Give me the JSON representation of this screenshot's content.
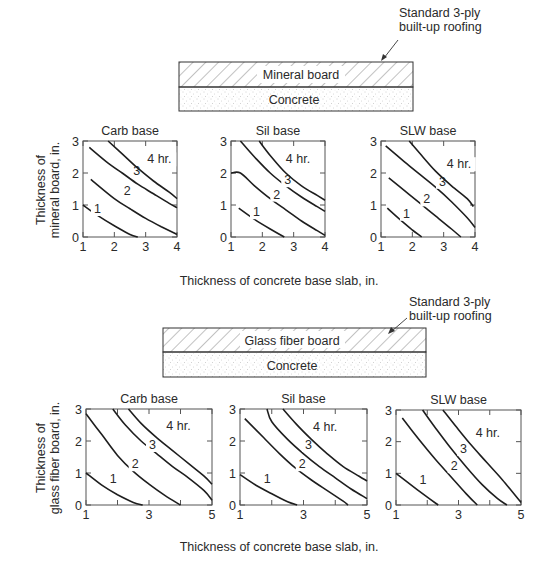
{
  "figure": {
    "section_1": {
      "assembly": {
        "roofing_note": [
          "Standard 3-ply",
          "built-up roofing"
        ],
        "board_label": "Mineral board",
        "base_label": "Concrete"
      },
      "ylabel": [
        "Thickness of",
        "mineral board, in."
      ],
      "xlabel": "Thickness of concrete base slab, in."
    },
    "section_2": {
      "assembly": {
        "roofing_note": [
          "Standard 3-ply",
          "built-up roofing"
        ],
        "board_label": "Glass fiber board",
        "base_label": "Concrete"
      },
      "ylabel": [
        "Thickness of",
        "glass fiber board, in."
      ],
      "xlabel": "Thickness of concrete base slab, in."
    }
  },
  "chart_data": [
    {
      "type": "line",
      "section": "mineral board",
      "title": "Carb base",
      "xlabel": "Thickness of concrete base slab, in.",
      "ylabel": "Thickness of mineral board, in.",
      "xlim": [
        1,
        4
      ],
      "ylim": [
        0,
        3
      ],
      "xticks": [
        1,
        2,
        3,
        4
      ],
      "yticks": [
        0,
        1,
        2,
        3
      ],
      "series": [
        {
          "name": "1",
          "label_at": [
            1.35,
            0.75
          ],
          "x": [
            1.0,
            1.5,
            2.0,
            2.5,
            2.75
          ],
          "y": [
            1.0,
            0.65,
            0.35,
            0.08,
            0.0
          ]
        },
        {
          "name": "2",
          "label_at": [
            2.3,
            1.3
          ],
          "x": [
            1.25,
            2.0,
            2.5,
            3.0,
            3.5,
            4.0
          ],
          "y": [
            1.8,
            1.2,
            0.88,
            0.58,
            0.32,
            0.08
          ]
        },
        {
          "name": "3",
          "label_at": [
            2.6,
            1.95
          ],
          "x": [
            1.2,
            1.75,
            2.25,
            2.75,
            3.25,
            3.75,
            4.0
          ],
          "y": [
            2.8,
            2.35,
            2.0,
            1.65,
            1.35,
            1.05,
            0.92
          ]
        },
        {
          "name": "4 hr.",
          "label_at": [
            3.05,
            2.3
          ],
          "x": [
            1.8,
            2.25,
            2.75,
            3.25,
            3.75,
            4.0
          ],
          "y": [
            3.0,
            2.6,
            2.15,
            1.75,
            1.4,
            1.2
          ]
        }
      ]
    },
    {
      "type": "line",
      "section": "mineral board",
      "title": "Sil base",
      "xlabel": "Thickness of concrete base slab, in.",
      "ylabel": "Thickness of mineral board, in.",
      "xlim": [
        1,
        4
      ],
      "ylim": [
        0,
        3
      ],
      "xticks": [
        1,
        2,
        3,
        4
      ],
      "yticks": [
        0,
        1,
        2,
        3
      ],
      "series": [
        {
          "name": "1",
          "label_at": [
            1.7,
            0.65
          ],
          "x": [
            1.25,
            1.75,
            2.25,
            2.7
          ],
          "y": [
            0.9,
            0.55,
            0.25,
            0.0
          ]
        },
        {
          "name": "2",
          "label_at": [
            2.35,
            1.2
          ],
          "x": [
            1.0,
            1.3,
            1.75,
            2.25,
            2.75,
            3.25,
            3.75,
            4.0
          ],
          "y": [
            2.0,
            2.0,
            1.6,
            1.2,
            0.85,
            0.5,
            0.2,
            0.05
          ]
        },
        {
          "name": "3",
          "label_at": [
            2.7,
            1.65
          ],
          "x": [
            1.3,
            1.75,
            2.25,
            2.75,
            3.25,
            3.75,
            4.0
          ],
          "y": [
            3.0,
            2.5,
            2.0,
            1.6,
            1.25,
            0.95,
            0.8
          ]
        },
        {
          "name": "4 hr.",
          "label_at": [
            2.75,
            2.3
          ],
          "x": [
            1.9,
            2.25,
            2.75,
            3.25,
            3.75,
            4.0
          ],
          "y": [
            3.0,
            2.55,
            2.0,
            1.6,
            1.3,
            1.15
          ]
        }
      ]
    },
    {
      "type": "line",
      "section": "mineral board",
      "title": "SLW base",
      "xlabel": "Thickness of concrete base slab, in.",
      "ylabel": "Thickness of mineral board, in.",
      "xlim": [
        1,
        4
      ],
      "ylim": [
        0,
        3
      ],
      "xticks": [
        1,
        2,
        3,
        4
      ],
      "yticks": [
        0,
        1,
        2,
        3
      ],
      "series": [
        {
          "name": "1",
          "label_at": [
            1.7,
            0.6
          ],
          "x": [
            1.2,
            1.6,
            2.0,
            2.3
          ],
          "y": [
            0.9,
            0.55,
            0.22,
            0.0
          ]
        },
        {
          "name": "2",
          "label_at": [
            2.35,
            1.05
          ],
          "x": [
            1.25,
            1.75,
            2.25,
            2.75,
            3.25,
            3.55
          ],
          "y": [
            1.85,
            1.45,
            1.05,
            0.65,
            0.25,
            0.0
          ]
        },
        {
          "name": "3",
          "label_at": [
            2.85,
            1.6
          ],
          "x": [
            1.15,
            1.75,
            2.25,
            2.75,
            3.25,
            3.75,
            4.0
          ],
          "y": [
            2.85,
            2.35,
            1.95,
            1.55,
            1.1,
            0.6,
            0.3
          ]
        },
        {
          "name": "4 hr.",
          "label_at": [
            3.1,
            2.15
          ],
          "x": [
            1.9,
            2.25,
            2.75,
            3.25,
            3.75,
            3.95
          ],
          "y": [
            3.0,
            2.6,
            2.05,
            1.6,
            1.2,
            0.95
          ]
        }
      ]
    },
    {
      "type": "line",
      "section": "glass fiber board",
      "title": "Carb base",
      "xlabel": "Thickness of concrete base slab, in.",
      "ylabel": "Thickness of glass fiber board, in.",
      "xlim": [
        1,
        5
      ],
      "ylim": [
        0,
        3
      ],
      "xticks": [
        1,
        2,
        3,
        4,
        5
      ],
      "xticklabels": [
        "1",
        "",
        "3",
        "",
        "5"
      ],
      "yticks": [
        0,
        1,
        2,
        3
      ],
      "series": [
        {
          "name": "1",
          "label_at": [
            1.75,
            0.7
          ],
          "x": [
            1.0,
            1.5,
            2.0,
            2.5,
            2.8
          ],
          "y": [
            1.0,
            0.62,
            0.32,
            0.08,
            0.0
          ]
        },
        {
          "name": "2",
          "label_at": [
            2.45,
            1.15
          ],
          "x": [
            1.0,
            1.5,
            2.0,
            2.5,
            3.0,
            3.5,
            4.0
          ],
          "y": [
            2.85,
            2.2,
            1.55,
            1.05,
            0.65,
            0.3,
            0.0
          ]
        },
        {
          "name": "3",
          "label_at": [
            3.0,
            1.75
          ],
          "x": [
            1.85,
            2.25,
            2.75,
            3.25,
            3.75,
            4.25,
            4.75,
            5.0
          ],
          "y": [
            3.0,
            2.5,
            2.0,
            1.6,
            1.2,
            0.85,
            0.45,
            0.15
          ]
        },
        {
          "name": "4 hr.",
          "label_at": [
            3.55,
            2.35
          ],
          "x": [
            2.35,
            2.75,
            3.25,
            3.75,
            4.25,
            4.75,
            5.0
          ],
          "y": [
            3.0,
            2.55,
            2.1,
            1.7,
            1.3,
            0.9,
            0.65
          ]
        }
      ]
    },
    {
      "type": "line",
      "section": "glass fiber board",
      "title": "Sil base",
      "xlabel": "Thickness of concrete base slab, in.",
      "ylabel": "Thickness of glass fiber board, in.",
      "xlim": [
        1,
        5
      ],
      "ylim": [
        0,
        3
      ],
      "xticks": [
        1,
        2,
        3,
        4,
        5
      ],
      "xticklabels": [
        "1",
        "",
        "3",
        "",
        "5"
      ],
      "yticks": [
        0,
        1,
        2,
        3
      ],
      "series": [
        {
          "name": "1",
          "label_at": [
            1.75,
            0.7
          ],
          "x": [
            1.0,
            1.5,
            2.0,
            2.5,
            2.8
          ],
          "y": [
            0.95,
            0.62,
            0.35,
            0.1,
            0.0
          ]
        },
        {
          "name": "2",
          "label_at": [
            2.85,
            1.15
          ],
          "x": [
            1.15,
            1.75,
            2.25,
            2.75,
            3.25,
            3.75,
            4.25,
            4.4
          ],
          "y": [
            2.7,
            2.1,
            1.6,
            1.15,
            0.78,
            0.45,
            0.12,
            0.0
          ]
        },
        {
          "name": "3",
          "label_at": [
            3.05,
            1.75
          ],
          "x": [
            1.85,
            2.0,
            2.5,
            3.0,
            3.5,
            4.0,
            4.5,
            5.0
          ],
          "y": [
            3.0,
            2.6,
            2.05,
            1.6,
            1.2,
            0.85,
            0.5,
            0.2
          ]
        },
        {
          "name": "4 hr.",
          "label_at": [
            3.3,
            2.3
          ],
          "x": [
            2.35,
            2.75,
            3.25,
            3.75,
            4.25,
            4.75,
            5.0
          ],
          "y": [
            3.0,
            2.55,
            2.05,
            1.6,
            1.2,
            0.9,
            0.75
          ]
        }
      ]
    },
    {
      "type": "line",
      "section": "glass fiber board",
      "title": "SLW base",
      "xlabel": "Thickness of concrete base slab, in.",
      "ylabel": "Thickness of glass fiber board, in.",
      "xlim": [
        1,
        5
      ],
      "ylim": [
        0,
        3
      ],
      "xticks": [
        1,
        2,
        3,
        4,
        5
      ],
      "xticklabels": [
        "1",
        "",
        "3",
        "",
        "5"
      ],
      "yticks": [
        0,
        1,
        2,
        3
      ],
      "series": [
        {
          "name": "1",
          "label_at": [
            1.75,
            0.65
          ],
          "x": [
            1.0,
            1.5,
            2.0,
            2.35
          ],
          "y": [
            1.0,
            0.62,
            0.25,
            0.0
          ]
        },
        {
          "name": "2",
          "label_at": [
            2.75,
            1.1
          ],
          "x": [
            1.2,
            1.75,
            2.25,
            2.75,
            3.25,
            3.6
          ],
          "y": [
            2.75,
            2.05,
            1.45,
            0.9,
            0.35,
            0.0
          ]
        },
        {
          "name": "3",
          "label_at": [
            3.05,
            1.65
          ],
          "x": [
            1.85,
            2.25,
            2.75,
            3.25,
            3.75,
            4.25,
            4.55
          ],
          "y": [
            3.0,
            2.45,
            1.8,
            1.2,
            0.65,
            0.2,
            0.0
          ]
        },
        {
          "name": "4 hr.",
          "label_at": [
            3.55,
            2.15
          ],
          "x": [
            2.5,
            2.9,
            3.4,
            3.9,
            4.4,
            5.0
          ],
          "y": [
            3.0,
            2.5,
            1.9,
            1.35,
            0.8,
            0.08
          ]
        }
      ]
    }
  ],
  "layout": {
    "panels": [
      {
        "left": 83,
        "right": 177,
        "top": 141,
        "bottom": 237
      },
      {
        "left": 231,
        "right": 325,
        "top": 141,
        "bottom": 237
      },
      {
        "left": 381,
        "right": 475,
        "top": 141,
        "bottom": 237
      },
      {
        "left": 86,
        "right": 212,
        "top": 409,
        "bottom": 505
      },
      {
        "left": 240,
        "right": 367,
        "top": 409,
        "bottom": 505
      },
      {
        "left": 396,
        "right": 521,
        "top": 410,
        "bottom": 505
      }
    ],
    "line_color": "#1e1e1e",
    "frame_color": "#555555"
  }
}
